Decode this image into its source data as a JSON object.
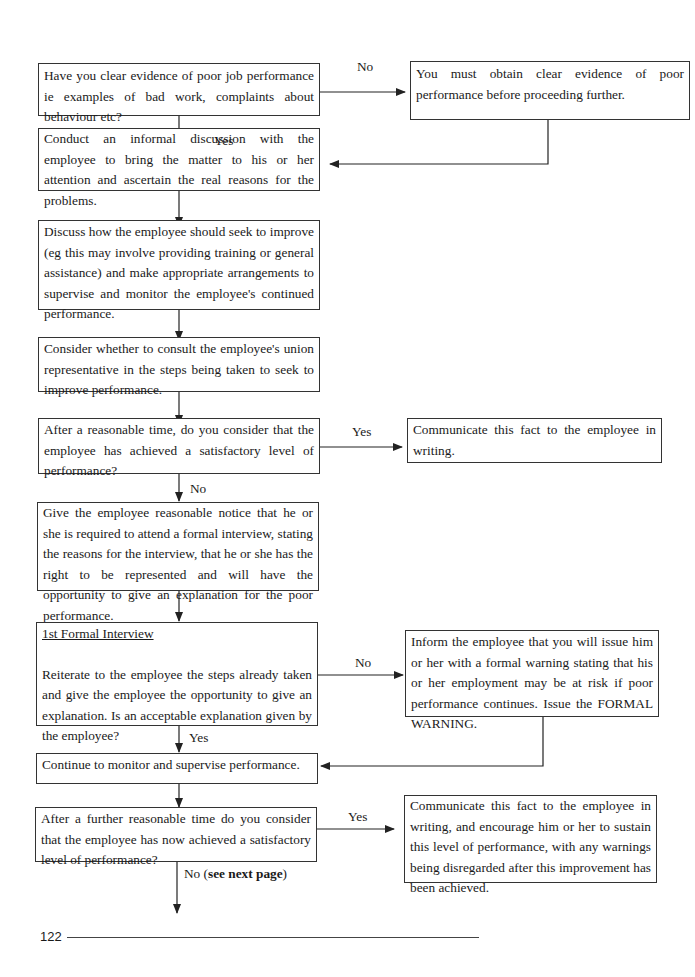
{
  "page": {
    "number": "122"
  },
  "flowchart": {
    "nodes": {
      "q_evidence": "Have you clear evidence of poor job performance ie examples of bad work, complaints about behaviour etc?",
      "obtain_evidence": "You must obtain clear evidence of poor performance before proceeding further.",
      "informal_discussion": "Conduct an informal discussion with the employee to bring the matter to his or her attention and ascertain the real reasons for the problems.",
      "discuss_improve": "Discuss how the employee should seek to improve (eg this may involve providing training or general assistance) and make appropriate arrangements to supervise and monitor the employee's continued performance.",
      "consult_union": "Consider whether to consult the employee's union representative in the steps being taken to seek to improve performance.",
      "q_satisfactory_1": "After a reasonable time, do you consider that the employee has achieved a satisfactory level of performance?",
      "communicate_writing": "Communicate this fact to the employee in writing.",
      "give_notice": "Give the employee reasonable notice that he or she is required to attend a formal interview, stating the reasons for the interview, that he or she has the right to be represented and will have the opportunity to give an explanation for the poor performance.",
      "formal_interview_heading": "1st Formal Interview",
      "formal_interview_body": "Reiterate to the employee the steps already taken and give the employee the opportunity to give an explanation.  Is an acceptable explanation given by the employee?",
      "formal_warning": "Inform the employee that you will issue him or her with a formal warning stating that his or her employment may be at risk if poor performance continues.  Issue the FORMAL WARNING.",
      "continue_monitor": "Continue to monitor and supervise performance.",
      "q_satisfactory_2": "After a further reasonable time do you consider that the employee has now achieved a satisfactory level of performance?",
      "communicate_sustain": "Communicate this fact to the employee in writing, and encourage him or her to sustain this level of performance, with any warnings being disregarded after this improvement has been achieved."
    },
    "labels": {
      "no_1": "No",
      "yes_1": "Yes",
      "yes_2": "Yes",
      "no_2": "No",
      "no_3": "No",
      "yes_3": "Yes",
      "yes_4": "Yes",
      "no_4_prefix": "No (",
      "no_4_bold": "see next page",
      "no_4_suffix": ")"
    }
  }
}
